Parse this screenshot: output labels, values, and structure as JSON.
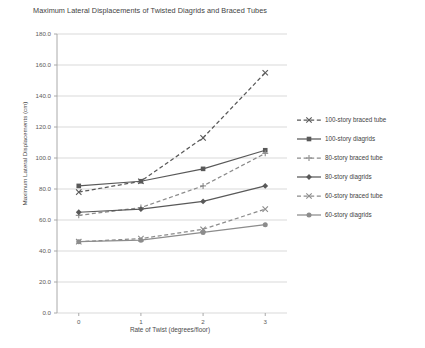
{
  "chart_data": {
    "type": "line",
    "title": "Maximum Lateral Displacements of Twisted Diagrids and Braced Tubes",
    "xlabel": "Rate of Twist (degrees/floor)",
    "ylabel": "Maximum Lateral Displacements (cm)",
    "x": [
      0,
      1,
      2,
      3
    ],
    "xticklabels": [
      "0",
      "1",
      "2",
      "3"
    ],
    "xlim": [
      -0.35,
      3.35
    ],
    "ylim": [
      0.0,
      180.0
    ],
    "yticklabels": [
      "0.0",
      "20.0",
      "40.0",
      "60.0",
      "80.0",
      "100.0",
      "120.0",
      "140.0",
      "160.0",
      "180.0"
    ],
    "ytickvalues": [
      0,
      20,
      40,
      60,
      80,
      100,
      120,
      140,
      160,
      180
    ],
    "grid": "horizontal",
    "legend_position": "right",
    "series": [
      {
        "name": "100-story braced tube",
        "values": [
          78,
          85,
          113,
          155
        ],
        "style": "dashed",
        "marker": "x",
        "color": "#595959"
      },
      {
        "name": "100-story diagrids",
        "values": [
          82,
          85,
          93,
          105
        ],
        "style": "solid",
        "marker": "square",
        "color": "#595959"
      },
      {
        "name": "80-story braced tube",
        "values": [
          63,
          68,
          82,
          103
        ],
        "style": "dashed",
        "marker": "plus",
        "color": "#8c8c8c"
      },
      {
        "name": "80-story diagrids",
        "values": [
          65,
          67,
          72,
          82
        ],
        "style": "solid",
        "marker": "diamond",
        "color": "#595959"
      },
      {
        "name": "60-story braced tube",
        "values": [
          46,
          48,
          54,
          67
        ],
        "style": "dashed",
        "marker": "x",
        "color": "#8c8c8c"
      },
      {
        "name": "60-story diagrids",
        "values": [
          46,
          47,
          52,
          57
        ],
        "style": "solid",
        "marker": "circle",
        "color": "#8c8c8c"
      }
    ]
  }
}
